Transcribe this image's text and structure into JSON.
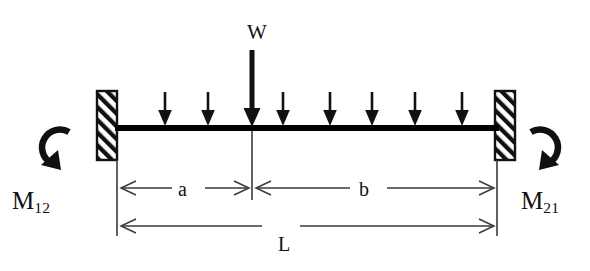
{
  "diagram": {
    "colors": {
      "ink": "#111111",
      "beam": "#000000",
      "background": "#ffffff",
      "thin_line": "#3a3a3a"
    },
    "labels": {
      "point_load": "W",
      "moment_left": "M",
      "moment_left_sub": "12",
      "moment_right": "M",
      "moment_right_sub": "21",
      "dim_a": "a",
      "dim_b": "b",
      "dim_l": "L"
    },
    "geometry": {
      "beam_left_x": 117,
      "beam_right_x": 497,
      "beam_y": 128,
      "beam_thickness": 6,
      "point_load_x": 252,
      "support_top_y": 91,
      "support_bottom_y": 160,
      "support_width": 20,
      "dim_ab_y": 188,
      "dim_l_y": 226
    },
    "distributed_load": {
      "arrow_count": 8,
      "arrow_x_positions": [
        165,
        208,
        283,
        330,
        372,
        415,
        462,
        247
      ],
      "arrow_top_y": 92,
      "arrow_tip_y": 126
    },
    "point_load_arrow": {
      "x": 252,
      "top_y": 50,
      "tip_y": 127
    },
    "supports": [
      {
        "name": "left-fixed-support",
        "x": 97,
        "y": 91
      },
      {
        "name": "right-fixed-support",
        "x": 495,
        "y": 91
      }
    ],
    "moments": [
      {
        "name": "left-moment-arrow",
        "direction": "counterclockwise",
        "cx": 55,
        "cy": 146
      },
      {
        "name": "right-moment-arrow",
        "direction": "clockwise",
        "cx": 545,
        "cy": 146
      }
    ]
  }
}
